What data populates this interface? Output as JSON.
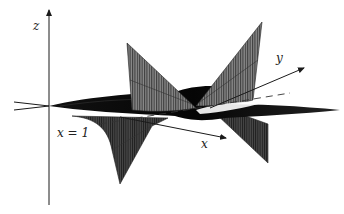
{
  "figure": {
    "type": "3d-surface-diagram",
    "axes": {
      "z_label": "z",
      "y_label": "y",
      "x_label": "x"
    },
    "annotation": {
      "label": "x = 1",
      "style": "dashed"
    },
    "colors": {
      "background": "#ffffff",
      "axis": "#1a1a1a",
      "surface_dark": "#0d0d0d",
      "surface_mid": "#5a5a5a",
      "surface_light": "#9a9a9a",
      "hatch": "#2a2a2a"
    }
  }
}
